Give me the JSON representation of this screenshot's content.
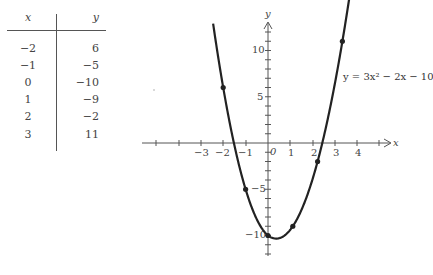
{
  "table": {
    "headers": {
      "x": "x",
      "y": "y"
    },
    "rows": [
      {
        "x": "−2",
        "y": "6"
      },
      {
        "x": "−1",
        "y": "−5"
      },
      {
        "x": "0",
        "y": "−10"
      },
      {
        "x": "1",
        "y": "−9"
      },
      {
        "x": "2",
        "y": "−2"
      },
      {
        "x": "3",
        "y": "11"
      }
    ]
  },
  "graph": {
    "x_axis_label": "x",
    "y_axis_label": "y",
    "x_tick_labels": [
      "−3",
      "−2",
      "−1",
      "0",
      "1",
      "2",
      "3",
      "4"
    ],
    "y_tick_labels": [
      "10",
      "5",
      "−5",
      "−10"
    ],
    "equation": "y = 3x² − 2x − 10",
    "curve_color": "#222222",
    "axis_color": "#555555"
  },
  "chart_data": {
    "type": "line",
    "title": "",
    "xlabel": "x",
    "ylabel": "y",
    "series": [
      {
        "name": "y = 3x^2 - 2x - 10",
        "kind": "curve",
        "function": "3x^2 - 2x - 10"
      },
      {
        "name": "plotted points",
        "kind": "scatter",
        "x": [
          -2,
          -1,
          0,
          1,
          2,
          3
        ],
        "y": [
          6,
          -5,
          -10,
          -9,
          -2,
          11
        ]
      }
    ],
    "table": {
      "columns": [
        "x",
        "y"
      ],
      "rows": [
        [
          -2,
          6
        ],
        [
          -1,
          -5
        ],
        [
          0,
          -10
        ],
        [
          1,
          -9
        ],
        [
          2,
          -2
        ],
        [
          3,
          11
        ]
      ]
    },
    "annotations": [
      "y = 3x² − 2x − 10"
    ],
    "xlim": [
      -5,
      5.5
    ],
    "ylim": [
      -12,
      13
    ],
    "x_ticks": [
      -5,
      -4,
      -3,
      -2,
      -1,
      0,
      1,
      2,
      3,
      4,
      5
    ],
    "y_ticks_labeled": [
      10,
      5,
      -5,
      -10
    ],
    "grid": false,
    "legend": "none"
  }
}
